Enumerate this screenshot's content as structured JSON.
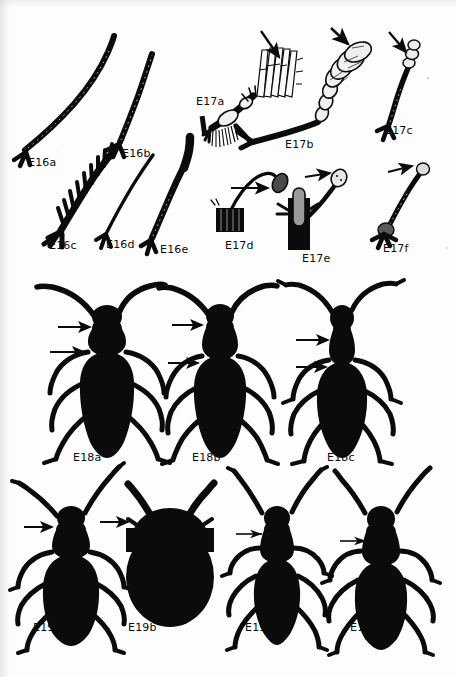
{
  "plate": {
    "title": "Coleoptera antennae and body-form plate",
    "background_color": "#fdfdfd",
    "ink_color": "#0b0b0b",
    "width": 456,
    "height": 677,
    "groups": [
      {
        "group_id": "E16",
        "caption_prefix": "E16",
        "subject": "elongate filiform and serrate antennae",
        "figures": [
          {
            "id": "E16a",
            "label": "E16a",
            "label_x": 28,
            "label_y": 157,
            "antenna_type": "filiform",
            "arrow": false
          },
          {
            "id": "E16b",
            "label": "E16b",
            "label_x": 122,
            "label_y": 148,
            "antenna_type": "filiform",
            "arrow": false
          },
          {
            "id": "E16c",
            "label": "E16c",
            "label_x": 49,
            "label_y": 240,
            "antenna_type": "serrate-pectinate",
            "arrow": false
          },
          {
            "id": "E16d",
            "label": "E16d",
            "label_x": 106,
            "label_y": 239,
            "antenna_type": "filiform-slender",
            "arrow": false
          },
          {
            "id": "E16e",
            "label": "E16e",
            "label_x": 160,
            "label_y": 244,
            "antenna_type": "moniliform-clavate",
            "arrow": false
          }
        ]
      },
      {
        "group_id": "E17",
        "caption_prefix": "E17",
        "subject": "clubbed, lamellate and flabellate antennae with indicator arrows",
        "figures": [
          {
            "id": "E17a",
            "label": "E17a",
            "label_x": 196,
            "label_y": 96,
            "antenna_type": "flabellate",
            "arrow": true
          },
          {
            "id": "E17b",
            "label": "E17b",
            "label_x": 285,
            "label_y": 139,
            "antenna_type": "lamellate",
            "arrow": true
          },
          {
            "id": "E17c",
            "label": "E17c",
            "label_x": 385,
            "label_y": 125,
            "antenna_type": "capitate",
            "arrow": true
          },
          {
            "id": "E17d",
            "label": "E17d",
            "label_x": 225,
            "label_y": 240,
            "antenna_type": "geniculate-clubbed",
            "arrow": true
          },
          {
            "id": "E17e",
            "label": "E17e",
            "label_x": 302,
            "label_y": 253,
            "antenna_type": "clavate",
            "arrow": true
          },
          {
            "id": "E17f",
            "label": "E17f",
            "label_x": 383,
            "label_y": 243,
            "antenna_type": "clavate",
            "arrow": true
          }
        ]
      },
      {
        "group_id": "E18",
        "caption_prefix": "E18",
        "subject": "long-horned beetle body silhouettes, dorsal view",
        "figures": [
          {
            "id": "E18a",
            "label": "E18a",
            "label_x": 73,
            "label_y": 452,
            "arrow_count": 2
          },
          {
            "id": "E18b",
            "label": "E18b",
            "label_x": 192,
            "label_y": 452,
            "arrow_count": 2
          },
          {
            "id": "E18c",
            "label": "E18c",
            "label_x": 327,
            "label_y": 452,
            "arrow_count": 2
          }
        ]
      },
      {
        "group_id": "E19",
        "caption_prefix": "E19",
        "subject": "beetle body silhouettes, dorsal view",
        "figures": [
          {
            "id": "E19a",
            "label": "E19a",
            "label_x": 33,
            "label_y": 622,
            "arrow_count": 1
          },
          {
            "id": "E19b",
            "label": "E19b",
            "label_x": 128,
            "label_y": 622,
            "arrow_count": 1
          },
          {
            "id": "E19c",
            "label": "E19c",
            "label_x": 245,
            "label_y": 622,
            "arrow_count": 1
          },
          {
            "id": "E19d",
            "label": "E19d",
            "label_x": 350,
            "label_y": 622,
            "arrow_count": 1
          }
        ]
      }
    ]
  }
}
